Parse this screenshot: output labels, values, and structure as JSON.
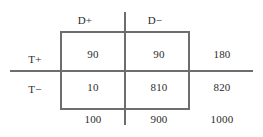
{
  "figure": {
    "type": "contingency-table",
    "line_color": "#6d6d6d",
    "text_color": "#2b2b2b",
    "background": "#ffffff"
  },
  "column_headers": [
    {
      "label": "D+"
    },
    {
      "label": "D−"
    }
  ],
  "row_headers": [
    {
      "label": "T+"
    },
    {
      "label": "T−"
    }
  ],
  "cells": [
    [
      {
        "value": "90"
      },
      {
        "value": "90"
      }
    ],
    [
      {
        "value": "10"
      },
      {
        "value": "810"
      }
    ]
  ],
  "row_totals": [
    {
      "value": "180"
    },
    {
      "value": "820"
    }
  ],
  "column_totals": [
    {
      "value": "100"
    },
    {
      "value": "900"
    }
  ],
  "grand_total": {
    "value": "1000"
  },
  "chart_data": {
    "type": "table",
    "title": "",
    "xlabel": "",
    "ylabel": "",
    "categories": [
      "D+",
      "D−"
    ],
    "row_categories": [
      "T+",
      "T−"
    ],
    "series": [
      {
        "name": "T+",
        "values": [
          90,
          90
        ]
      },
      {
        "name": "T−",
        "values": [
          10,
          810
        ]
      }
    ],
    "row_margins": [
      180,
      820
    ],
    "column_margins": [
      100,
      900
    ],
    "total": 1000,
    "grid": false,
    "legend": "none"
  }
}
